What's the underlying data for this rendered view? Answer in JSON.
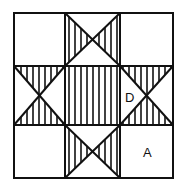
{
  "diagram": {
    "type": "quilt-block-star",
    "grid": {
      "x": [
        14,
        65,
        120,
        173
      ],
      "y": [
        13,
        66,
        125,
        178
      ]
    },
    "stroke_color": "#111111",
    "background": "#ffffff",
    "labels": [
      {
        "text": "D",
        "x": 130,
        "y": 102,
        "region": "right-middle-cell-left-triangle"
      },
      {
        "text": "A",
        "x": 148,
        "y": 157,
        "region": "bottom-right-corner-cell"
      }
    ],
    "shaded_regions": [
      "center-square",
      "top-cell-left-triangle",
      "top-cell-right-triangle",
      "bottom-cell-left-triangle",
      "bottom-cell-right-triangle",
      "left-cell-top-triangle",
      "left-cell-bottom-triangle",
      "right-cell-top-triangle",
      "right-cell-bottom-triangle"
    ],
    "hatch": "vertical-stripes"
  }
}
